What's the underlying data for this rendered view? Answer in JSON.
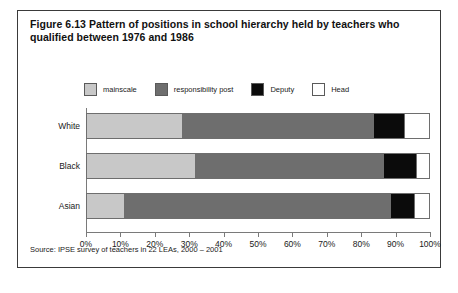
{
  "figure": {
    "caption": "Figure 6.13 Pattern of positions in school hierarchy held by teachers who qualified between 1976 and 1986",
    "source_note": "Source: IPSE survey of teachers in 22 LEAs, 2000 – 2001"
  },
  "legend": {
    "items": [
      {
        "label": "mainscale",
        "color": "#c8c8c8",
        "swatch": "legend-swatch-mainscale"
      },
      {
        "label": "responsibility post",
        "color": "#6e6e6e",
        "swatch": "legend-swatch-responsibility-post"
      },
      {
        "label": "Deputy",
        "color": "#0b0b0b",
        "swatch": "legend-swatch-deputy"
      },
      {
        "label": "Head",
        "color": "#ffffff",
        "swatch": "legend-swatch-head"
      }
    ]
  },
  "axis": {
    "x_tick_labels": [
      "0%",
      "10%",
      "20%",
      "30%",
      "40%",
      "50%",
      "60%",
      "70%",
      "80%",
      "90%",
      "100%"
    ],
    "category_labels": [
      "White",
      "Black",
      "Asian"
    ]
  },
  "chart_data": {
    "type": "bar",
    "orientation": "horizontal",
    "stacked": true,
    "normalized_percent": true,
    "title": "Figure 6.13 Pattern of positions in school hierarchy held by teachers who qualified between 1976 and 1986",
    "xlabel": "",
    "ylabel": "",
    "xlim": [
      0,
      100
    ],
    "xticks": [
      0,
      10,
      20,
      30,
      40,
      50,
      60,
      70,
      80,
      90,
      100
    ],
    "xtick_labels": [
      "0%",
      "10%",
      "20%",
      "30%",
      "40%",
      "50%",
      "60%",
      "70%",
      "80%",
      "90%",
      "100%"
    ],
    "grid": false,
    "legend_position": "top",
    "categories": [
      "White",
      "Black",
      "Asian"
    ],
    "series": [
      {
        "name": "mainscale",
        "color": "#c8c8c8",
        "values": [
          28,
          32,
          11
        ]
      },
      {
        "name": "responsibility post",
        "color": "#6e6e6e",
        "values": [
          56,
          55,
          78
        ]
      },
      {
        "name": "Deputy",
        "color": "#0b0b0b",
        "values": [
          9,
          9.5,
          7
        ]
      },
      {
        "name": "Head",
        "color": "#ffffff",
        "values": [
          7,
          3.5,
          4
        ]
      }
    ],
    "annotations": [
      "Source: IPSE survey of teachers in 22 LEAs, 2000 – 2001"
    ]
  }
}
